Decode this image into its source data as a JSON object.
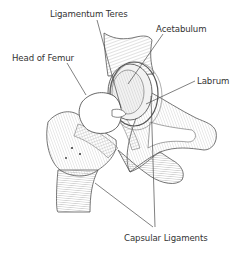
{
  "diagram": {
    "background_color": "#ffffff",
    "line_color": "#4a4a4a",
    "label_color": "#333333",
    "labels": [
      {
        "id": "ligamentum-teres",
        "text": "Ligamentum Teres",
        "x": 50,
        "y": 9
      },
      {
        "id": "acetabulum",
        "text": "Acetabulum",
        "x": 156,
        "y": 24
      },
      {
        "id": "head-of-femur",
        "text": "Head of Femur",
        "x": 12,
        "y": 53
      },
      {
        "id": "labrum",
        "text": "Labrum",
        "x": 197,
        "y": 76
      },
      {
        "id": "capsular-ligaments",
        "text": "Capsular Ligaments",
        "x": 124,
        "y": 233
      }
    ],
    "structures": [
      "femur-shaft",
      "femoral-head",
      "greater-trochanter",
      "acetabulum-socket",
      "labrum-ring",
      "ligamentum-teres",
      "pubic-ramus",
      "ischial-ramus",
      "ilium",
      "capsular-ligaments"
    ]
  }
}
